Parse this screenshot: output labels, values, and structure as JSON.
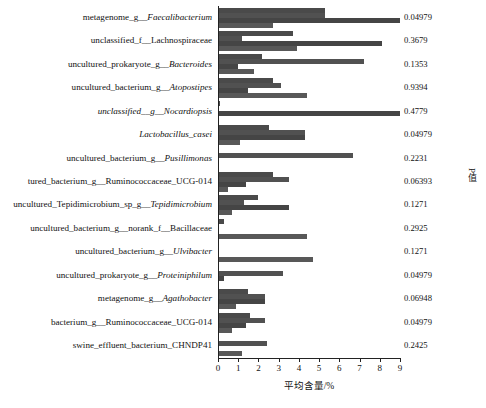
{
  "chart_data": {
    "type": "bar",
    "orientation": "horizontal",
    "grouped": true,
    "title": "",
    "xlabel": "平均含量/%",
    "ylabel": "",
    "xlim": [
      0,
      9
    ],
    "xticks": [
      0,
      1,
      2,
      3,
      4,
      5,
      6,
      7,
      8,
      9
    ],
    "xtick_labels": [
      "0",
      "1",
      "2",
      "3",
      "4",
      "5",
      "6",
      "7",
      "8",
      "9"
    ],
    "grid": false,
    "legend": "none",
    "right_axis_label": "P值",
    "categories": [
      "metagenome_g__Faecalibacterium",
      "unclassified_f__Lachnospiraceae",
      "uncultured_prokaryote_g__Bacteroides",
      "uncultured_bacterium_g__Atopostipes",
      "unclassified__g__Nocardiopsis",
      "Lactobacillus_casei",
      "uncultured_bacterium_g__Pusillimonas",
      "tured_bacterium_g__Ruminococcaceae_UCG-014",
      "uncultured_Tepidimicrobium_sp_g__Tepidimicrobium",
      "uncultured_bacterium_g__norank_f__Bacillaceae",
      "uncultured_bacterium_g__Ulvibacter",
      "uncultured_prokaryote_g__Proteiniphilum",
      "metagenome_g__Agathobacter",
      "bacterium_g__Ruminococcaceae_UCG-014",
      "swine_effluent_bacterium_CHNDP41"
    ],
    "category_parts": [
      {
        "plain": "metagenome_g_",
        "italic": "_Faecalibacterium"
      },
      {
        "plain": "unclassified_f__Lachnospiraceae",
        "italic": ""
      },
      {
        "plain": "uncultured_prokaryote_g_",
        "italic": "_Bacteroides"
      },
      {
        "plain": "uncultured_bacterium_g_",
        "italic": "_Atopostipes"
      },
      {
        "plain": "",
        "italic": "unclassified__g__Nocardiopsis"
      },
      {
        "plain": "",
        "italic": "Lactobacillus_casei"
      },
      {
        "plain": "uncultured_bacterium_g_",
        "italic": "_Pusillimonas"
      },
      {
        "plain": "tured_bacterium_g__Ruminococcaceae_UCG-014",
        "italic": ""
      },
      {
        "plain": "uncultured_Tepidimicrobium_sp_g_",
        "italic": "_Tepidimicrobium"
      },
      {
        "plain": "uncultured_bacterium_g__norank_f__Bacillaceae",
        "italic": ""
      },
      {
        "plain": "uncultured_bacterium_g_",
        "italic": "_Ulvibacter"
      },
      {
        "plain": "uncultured_prokaryote_g_",
        "italic": "_Proteiniphilum"
      },
      {
        "plain": "metagenome_g_",
        "italic": "_Agathobacter"
      },
      {
        "plain": "bacterium_g__Ruminococcaceae_UCG-014",
        "italic": ""
      },
      {
        "plain": "swine_effluent_bacterium_CHNDP41",
        "italic": ""
      }
    ],
    "series": [
      {
        "name": "group1",
        "values": [
          5.3,
          3.7,
          2.2,
          2.7,
          0.1,
          2.5,
          0.05,
          2.7,
          2.0,
          0.3,
          0.05,
          0.05,
          1.5,
          1.6,
          0.05
        ]
      },
      {
        "name": "group2",
        "values": [
          5.3,
          1.2,
          7.2,
          3.1,
          0.05,
          4.3,
          6.7,
          3.5,
          1.3,
          0.05,
          0.05,
          3.2,
          2.3,
          2.3,
          2.4
        ]
      },
      {
        "name": "group3",
        "values": [
          9.0,
          8.1,
          1.0,
          1.5,
          9.0,
          4.3,
          0.05,
          1.4,
          3.5,
          0.05,
          0.05,
          0.3,
          2.3,
          1.4,
          0.05
        ]
      },
      {
        "name": "group4",
        "values": [
          2.7,
          3.9,
          1.8,
          4.4,
          0.05,
          1.1,
          0.05,
          0.5,
          0.7,
          4.4,
          4.7,
          0.05,
          0.9,
          0.7,
          1.2
        ]
      }
    ],
    "p_values": [
      "0.04979",
      "0.3679",
      "0.1353",
      "0.9394",
      "0.4779",
      "0.04979",
      "0.2231",
      "0.06393",
      "0.1271",
      "0.2925",
      "0.1271",
      "0.04979",
      "0.06948",
      "0.04979",
      "0.2425"
    ],
    "bar_color": "#4d4d4d"
  }
}
